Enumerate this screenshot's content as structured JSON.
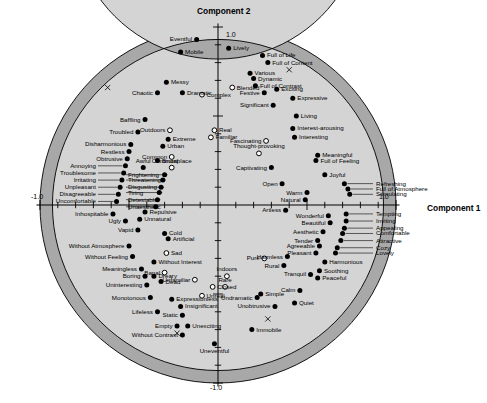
{
  "chart_data": {
    "type": "scatter",
    "title": "",
    "xlabel": "Component 1",
    "ylabel": "Component 2",
    "xlim": [
      -1.0,
      1.0
    ],
    "ylim": [
      -1.0,
      1.0
    ],
    "grid": false,
    "legend": null,
    "axis_labels": {
      "top": "1.0",
      "bottom": "-1.0",
      "left": "-1.0",
      "right": "1.0"
    },
    "marker_styles": {
      "filled": "solid black dot — high communality",
      "open": "open circle — low communality"
    },
    "annulus_bands": {
      "outer_dark": "#a8a8a8",
      "inner_light": "#d4d4d4",
      "outer_radius": 1.0,
      "mid_radius": 0.93,
      "inner_radius": 0.82
    },
    "points": [
      {
        "label": "Eventful",
        "x": -0.12,
        "y": 0.93,
        "fill": "filled",
        "pos": "r"
      },
      {
        "label": "Mobile",
        "x": -0.21,
        "y": 0.86,
        "fill": "filled",
        "pos": "l"
      },
      {
        "label": "Lively",
        "x": 0.06,
        "y": 0.88,
        "fill": "filled",
        "pos": "l"
      },
      {
        "label": "Full of Life",
        "x": 0.25,
        "y": 0.84,
        "fill": "filled",
        "pos": "l"
      },
      {
        "label": "Full of Content",
        "x": 0.28,
        "y": 0.8,
        "fill": "filled",
        "pos": "l"
      },
      {
        "label": "Various",
        "x": 0.18,
        "y": 0.74,
        "fill": "filled",
        "pos": "l"
      },
      {
        "label": "Dynamic",
        "x": 0.2,
        "y": 0.71,
        "fill": "filled",
        "pos": "l"
      },
      {
        "label": "Full of Contrast",
        "x": 0.21,
        "y": 0.67,
        "fill": "filled",
        "pos": "l"
      },
      {
        "label": "Blended",
        "x": 0.08,
        "y": 0.66,
        "fill": "open",
        "pos": "l"
      },
      {
        "label": "Festive",
        "x": 0.26,
        "y": 0.63,
        "fill": "filled",
        "pos": "r"
      },
      {
        "label": "Exciting",
        "x": 0.33,
        "y": 0.65,
        "fill": "filled",
        "pos": "l"
      },
      {
        "label": "Expressive",
        "x": 0.42,
        "y": 0.6,
        "fill": "filled",
        "pos": "l"
      },
      {
        "label": "Significant",
        "x": 0.31,
        "y": 0.56,
        "fill": "filled",
        "pos": "r"
      },
      {
        "label": "Living",
        "x": 0.44,
        "y": 0.5,
        "fill": "filled",
        "pos": "l"
      },
      {
        "label": "Interest-arousing",
        "x": 0.42,
        "y": 0.43,
        "fill": "filled",
        "pos": "l"
      },
      {
        "label": "Interesting",
        "x": 0.43,
        "y": 0.38,
        "fill": "filled",
        "pos": "l"
      },
      {
        "label": "Fascinating",
        "x": 0.27,
        "y": 0.36,
        "fill": "open",
        "pos": "r"
      },
      {
        "label": "Thought-provoking",
        "x": 0.23,
        "y": 0.29,
        "fill": "open",
        "pos": "c"
      },
      {
        "label": "Meaningful",
        "x": 0.56,
        "y": 0.28,
        "fill": "filled",
        "pos": "l"
      },
      {
        "label": "Full of Feeling",
        "x": 0.55,
        "y": 0.25,
        "fill": "filled",
        "pos": "l"
      },
      {
        "label": "Captivating",
        "x": 0.3,
        "y": 0.21,
        "fill": "filled",
        "pos": "r"
      },
      {
        "label": "Joyful",
        "x": 0.6,
        "y": 0.17,
        "fill": "filled",
        "pos": "l"
      },
      {
        "label": "Open",
        "x": 0.36,
        "y": 0.12,
        "fill": "filled",
        "pos": "r"
      },
      {
        "label": "Warm",
        "x": 0.5,
        "y": 0.07,
        "fill": "filled",
        "pos": "r"
      },
      {
        "label": "Natural",
        "x": 0.49,
        "y": 0.03,
        "fill": "filled",
        "pos": "r"
      },
      {
        "label": "Refreshing",
        "x": 0.71,
        "y": 0.12,
        "fill": "filled",
        "pos": "leader"
      },
      {
        "label": "Full of Atmosphere",
        "x": 0.73,
        "y": 0.09,
        "fill": "filled",
        "pos": "leader"
      },
      {
        "label": "Stimulating",
        "x": 0.74,
        "y": 0.06,
        "fill": "filled",
        "pos": "leader"
      },
      {
        "label": "Artless",
        "x": 0.38,
        "y": -0.03,
        "fill": "filled",
        "pos": "r"
      },
      {
        "label": "Wonderful",
        "x": 0.62,
        "y": -0.06,
        "fill": "filled",
        "pos": "r"
      },
      {
        "label": "Beautiful",
        "x": 0.63,
        "y": -0.1,
        "fill": "filled",
        "pos": "r"
      },
      {
        "label": "Aesthetic",
        "x": 0.59,
        "y": -0.15,
        "fill": "filled",
        "pos": "r"
      },
      {
        "label": "Tender",
        "x": 0.56,
        "y": -0.2,
        "fill": "filled",
        "pos": "r"
      },
      {
        "label": "Agreeable",
        "x": 0.57,
        "y": -0.23,
        "fill": "filled",
        "pos": "r"
      },
      {
        "label": "Pleasant",
        "x": 0.55,
        "y": -0.27,
        "fill": "filled",
        "pos": "r"
      },
      {
        "label": "Tempting",
        "x": 0.72,
        "y": -0.05,
        "fill": "filled",
        "pos": "leader"
      },
      {
        "label": "Inviting",
        "x": 0.72,
        "y": -0.09,
        "fill": "filled",
        "pos": "leader"
      },
      {
        "label": "Appealing",
        "x": 0.71,
        "y": -0.13,
        "fill": "filled",
        "pos": "leader"
      },
      {
        "label": "Comfortable",
        "x": 0.7,
        "y": -0.16,
        "fill": "filled",
        "pos": "leader"
      },
      {
        "label": "Attractive",
        "x": 0.69,
        "y": -0.2,
        "fill": "filled",
        "pos": "leader"
      },
      {
        "label": "Cozy",
        "x": 0.67,
        "y": -0.24,
        "fill": "filled",
        "pos": "leader"
      },
      {
        "label": "Lovely",
        "x": 0.66,
        "y": -0.27,
        "fill": "filled",
        "pos": "leader"
      },
      {
        "label": "Harmonious",
        "x": 0.6,
        "y": -0.32,
        "fill": "filled",
        "pos": "l"
      },
      {
        "label": "Soothing",
        "x": 0.57,
        "y": -0.37,
        "fill": "filled",
        "pos": "l"
      },
      {
        "label": "Peaceful",
        "x": 0.56,
        "y": -0.41,
        "fill": "filled",
        "pos": "l"
      },
      {
        "label": "Tranquil",
        "x": 0.52,
        "y": -0.39,
        "fill": "filled",
        "pos": "r"
      },
      {
        "label": "Harmless",
        "x": 0.39,
        "y": -0.29,
        "fill": "filled",
        "pos": "r"
      },
      {
        "label": "Rural",
        "x": 0.37,
        "y": -0.34,
        "fill": "filled",
        "pos": "r"
      },
      {
        "label": "Pure",
        "x": 0.26,
        "y": -0.3,
        "fill": "open",
        "pos": "r"
      },
      {
        "label": "Calm",
        "x": 0.46,
        "y": -0.48,
        "fill": "filled",
        "pos": "r"
      },
      {
        "label": "Quiet",
        "x": 0.43,
        "y": -0.55,
        "fill": "filled",
        "pos": "l"
      },
      {
        "label": "Simple",
        "x": 0.24,
        "y": -0.5,
        "fill": "filled",
        "pos": "l"
      },
      {
        "label": "Undramatic",
        "x": 0.22,
        "y": -0.52,
        "fill": "filled",
        "pos": "r"
      },
      {
        "label": "Unobtrusive",
        "x": 0.32,
        "y": -0.57,
        "fill": "filled",
        "pos": "r"
      },
      {
        "label": "Immobile",
        "x": 0.19,
        "y": -0.7,
        "fill": "filled",
        "pos": "l"
      },
      {
        "label": "Indoors",
        "x": 0.05,
        "y": -0.4,
        "fill": "open",
        "pos": "c"
      },
      {
        "label": "Rare",
        "x": 0.04,
        "y": -0.46,
        "fill": "open",
        "pos": "c"
      },
      {
        "label": "Unreal",
        "x": -0.09,
        "y": -0.51,
        "fill": "open",
        "pos": "l"
      },
      {
        "label": "Unfamiliar",
        "x": -0.13,
        "y": -0.42,
        "fill": "open",
        "pos": "r"
      },
      {
        "label": "Banal",
        "x": -0.3,
        "y": -0.38,
        "fill": "open",
        "pos": "r"
      },
      {
        "label": "Closed",
        "x": -0.03,
        "y": -0.46,
        "fill": "open",
        "pos": "l"
      },
      {
        "label": "Uneventful",
        "x": -0.02,
        "y": -0.78,
        "fill": "filled",
        "pos": "below"
      },
      {
        "label": "Without Contrast",
        "x": -0.2,
        "y": -0.73,
        "fill": "filled",
        "pos": "r"
      },
      {
        "label": "Unexciting",
        "x": -0.17,
        "y": -0.68,
        "fill": "filled",
        "pos": "l"
      },
      {
        "label": "Empty",
        "x": -0.23,
        "y": -0.68,
        "fill": "filled",
        "pos": "r"
      },
      {
        "label": "Static",
        "x": -0.2,
        "y": -0.62,
        "fill": "filled",
        "pos": "r"
      },
      {
        "label": "Insignificant",
        "x": -0.21,
        "y": -0.57,
        "fill": "filled",
        "pos": "l"
      },
      {
        "label": "Expressionless",
        "x": -0.26,
        "y": -0.53,
        "fill": "filled",
        "pos": "l"
      },
      {
        "label": "Lifeless",
        "x": -0.34,
        "y": -0.6,
        "fill": "filled",
        "pos": "r"
      },
      {
        "label": "Monotonous",
        "x": -0.38,
        "y": -0.52,
        "fill": "filled",
        "pos": "r"
      },
      {
        "label": "Uninteresting",
        "x": -0.4,
        "y": -0.45,
        "fill": "filled",
        "pos": "r"
      },
      {
        "label": "Dead",
        "x": -0.32,
        "y": -0.43,
        "fill": "filled",
        "pos": "l"
      },
      {
        "label": "Dreary",
        "x": -0.36,
        "y": -0.4,
        "fill": "filled",
        "pos": "l"
      },
      {
        "label": "Boring",
        "x": -0.41,
        "y": -0.4,
        "fill": "filled",
        "pos": "r"
      },
      {
        "label": "Meaningless",
        "x": -0.43,
        "y": -0.36,
        "fill": "filled",
        "pos": "r"
      },
      {
        "label": "Without Interest",
        "x": -0.36,
        "y": -0.32,
        "fill": "filled",
        "pos": "l"
      },
      {
        "label": "Without Feeling",
        "x": -0.48,
        "y": -0.29,
        "fill": "filled",
        "pos": "r"
      },
      {
        "label": "Without Atmosphere",
        "x": -0.5,
        "y": -0.23,
        "fill": "filled",
        "pos": "r"
      },
      {
        "label": "Sad",
        "x": -0.29,
        "y": -0.27,
        "fill": "open",
        "pos": "l"
      },
      {
        "label": "Artificial",
        "x": -0.28,
        "y": -0.19,
        "fill": "filled",
        "pos": "l"
      },
      {
        "label": "Cold",
        "x": -0.3,
        "y": -0.16,
        "fill": "filled",
        "pos": "l"
      },
      {
        "label": "Vapid",
        "x": -0.45,
        "y": -0.14,
        "fill": "filled",
        "pos": "r"
      },
      {
        "label": "Ugly",
        "x": -0.52,
        "y": -0.09,
        "fill": "filled",
        "pos": "r"
      },
      {
        "label": "Unnatural",
        "x": -0.44,
        "y": -0.08,
        "fill": "filled",
        "pos": "l"
      },
      {
        "label": "Repulsive",
        "x": -0.41,
        "y": -0.04,
        "fill": "filled",
        "pos": "l"
      },
      {
        "label": "Inhospitable",
        "x": -0.59,
        "y": -0.05,
        "fill": "filled",
        "pos": "r"
      },
      {
        "label": "Uncomfortable",
        "x": -0.57,
        "y": 0.02,
        "fill": "filled",
        "pos": "leader-l"
      },
      {
        "label": "Disagreeable",
        "x": -0.56,
        "y": 0.06,
        "fill": "filled",
        "pos": "leader-l"
      },
      {
        "label": "Unpleasant",
        "x": -0.55,
        "y": 0.1,
        "fill": "filled",
        "pos": "leader-l"
      },
      {
        "label": "Irritating",
        "x": -0.54,
        "y": 0.14,
        "fill": "filled",
        "pos": "leader-l"
      },
      {
        "label": "Troublesome",
        "x": -0.53,
        "y": 0.18,
        "fill": "filled",
        "pos": "leader-l"
      },
      {
        "label": "Annoying",
        "x": -0.52,
        "y": 0.22,
        "fill": "filled",
        "pos": "leader-l"
      },
      {
        "label": "Frightening",
        "x": -0.3,
        "y": 0.17,
        "fill": "filled",
        "pos": "leader-r"
      },
      {
        "label": "Threatening",
        "x": -0.31,
        "y": 0.14,
        "fill": "filled",
        "pos": "leader-r"
      },
      {
        "label": "Disgusting",
        "x": -0.32,
        "y": 0.1,
        "fill": "filled",
        "pos": "leader-r"
      },
      {
        "label": "Tiring",
        "x": -0.33,
        "y": 0.07,
        "fill": "filled",
        "pos": "leader-r"
      },
      {
        "label": "Detestable",
        "x": -0.34,
        "y": 0.03,
        "fill": "filled",
        "pos": "leader-r"
      },
      {
        "label": "Unaesthetic",
        "x": -0.35,
        "y": -0.01,
        "fill": "filled",
        "pos": "leader-r"
      },
      {
        "label": "Awful",
        "x": -0.42,
        "y": 0.21,
        "fill": "filled",
        "pos": "c"
      },
      {
        "label": "Obtrusive",
        "x": -0.51,
        "y": 0.26,
        "fill": "filled",
        "pos": "r"
      },
      {
        "label": "Restless",
        "x": -0.5,
        "y": 0.3,
        "fill": "filled",
        "pos": "r"
      },
      {
        "label": "Disharmonious",
        "x": -0.49,
        "y": 0.34,
        "fill": "filled",
        "pos": "r"
      },
      {
        "label": "Brutal",
        "x": -0.34,
        "y": 0.25,
        "fill": "filled",
        "pos": "l"
      },
      {
        "label": "Urban",
        "x": -0.31,
        "y": 0.33,
        "fill": "filled",
        "pos": "l"
      },
      {
        "label": "Extreme",
        "x": -0.28,
        "y": 0.37,
        "fill": "filled",
        "pos": "l"
      },
      {
        "label": "Troubled",
        "x": -0.45,
        "y": 0.41,
        "fill": "filled",
        "pos": "r"
      },
      {
        "label": "Baffling",
        "x": -0.41,
        "y": 0.48,
        "fill": "filled",
        "pos": "r"
      },
      {
        "label": "Chaotic",
        "x": -0.34,
        "y": 0.63,
        "fill": "filled",
        "pos": "r"
      },
      {
        "label": "Messy",
        "x": -0.29,
        "y": 0.69,
        "fill": "filled",
        "pos": "l"
      },
      {
        "label": "Dramatic",
        "x": -0.2,
        "y": 0.63,
        "fill": "filled",
        "pos": "l"
      },
      {
        "label": "Complex",
        "x": -0.09,
        "y": 0.62,
        "fill": "open",
        "pos": "l"
      },
      {
        "label": "Outdoors",
        "x": -0.27,
        "y": 0.42,
        "fill": "open",
        "pos": "r"
      },
      {
        "label": "Common",
        "x": -0.26,
        "y": 0.27,
        "fill": "open",
        "pos": "r"
      },
      {
        "label": "Commonplace",
        "x": -0.26,
        "y": 0.21,
        "fill": "open",
        "pos": "c"
      },
      {
        "label": "Real",
        "x": -0.02,
        "y": 0.42,
        "fill": "open",
        "pos": "l"
      },
      {
        "label": "Familiar",
        "x": -0.04,
        "y": 0.38,
        "fill": "open",
        "pos": "l"
      }
    ]
  }
}
